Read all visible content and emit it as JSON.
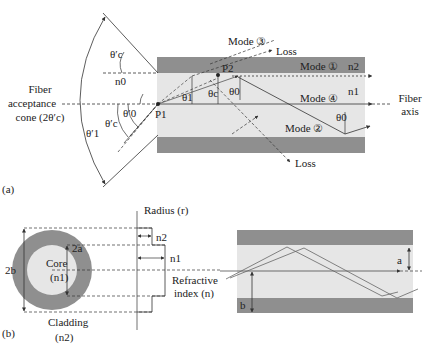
{
  "colors": {
    "cladding": "#8f8f8f",
    "core": "#e6e6e6",
    "line": "#333333",
    "background": "#ffffff"
  },
  "part_a": {
    "panel_label": "(a)",
    "acceptance_cone_label": [
      "Fiber",
      "acceptance",
      "cone (2θ′c)"
    ],
    "fiber_axis_label": [
      "Fiber",
      "axis"
    ],
    "angles": {
      "theta_c_prime_top": "θ′c",
      "theta_0_prime": "θ′0",
      "theta_c_prime_bottom": "θ′c",
      "theta_1_prime": "θ′1",
      "theta_1": "θ1",
      "theta_c": "θc",
      "theta_0_top": "θ0",
      "theta_0_bottom": "θ0"
    },
    "n0": "n0",
    "n1": "n1",
    "n2": "n2",
    "points": {
      "p1": "P1",
      "p2": "P2"
    },
    "modes": {
      "mode1": "Mode ①",
      "mode2": "Mode ②",
      "mode3": "Mode ③",
      "mode4": "Mode ④"
    },
    "loss_top": "Loss",
    "loss_bottom": "Loss"
  },
  "part_b": {
    "panel_label": "(b)",
    "diameter_outer": "2b",
    "diameter_inner": "2a",
    "core_label": "Core",
    "core_index": "(n1)",
    "cladding_label": "Cladding",
    "cladding_index": "(n2)",
    "radius_axis": "Radius (r)",
    "index_axis": [
      "Refractive",
      "index (n)"
    ],
    "n2": "n2",
    "n1": "n1",
    "radius_a": "a",
    "radius_b": "b"
  }
}
